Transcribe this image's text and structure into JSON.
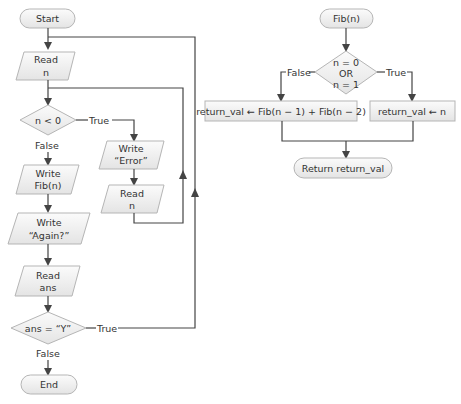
{
  "top_caption": "…e program … the … pseudocode … the … Fib(n) … flowchart …",
  "main_flow": {
    "start": "Start",
    "read_n": [
      "Read",
      "n"
    ],
    "cond_n": "n < 0",
    "cond_n_true": "True",
    "cond_n_false": "False",
    "write_error": [
      "Write",
      "“Error”"
    ],
    "read_n2": [
      "Read",
      "n"
    ],
    "write_fib": [
      "Write",
      "Fib(n)"
    ],
    "write_again": [
      "Write",
      "“Again?”"
    ],
    "read_ans": [
      "Read",
      "ans"
    ],
    "cond_ans": "ans = “Y”",
    "cond_ans_true": "True",
    "cond_ans_false": "False",
    "end": "End"
  },
  "fib_flow": {
    "start": "Fib(n)",
    "cond": [
      "n = 0",
      "OR",
      "n = 1"
    ],
    "cond_false": "False",
    "cond_true": "True",
    "recursive": "return_val ← Fib(n − 1) + Fib(n − 2)",
    "base": "return_val ← n",
    "return": "Return return_val"
  }
}
